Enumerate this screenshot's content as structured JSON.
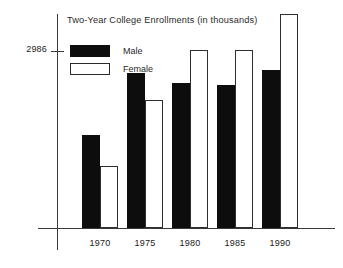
{
  "chart_data": {
    "type": "bar",
    "title": "Two-Year College Enrollments (in thousands)",
    "xlabel": "",
    "ylabel": "",
    "categories": [
      "1970",
      "1975",
      "1980",
      "1985",
      "1990"
    ],
    "series": [
      {
        "name": "Male",
        "color": "#0d0d0d",
        "fill": "solid-black",
        "values": [
          1299,
          2159,
          2024,
          1991,
          2210
        ]
      },
      {
        "name": "Female",
        "color": "#ffffff",
        "fill": "white-outlined",
        "values": [
          860,
          1788,
          2480,
          2480,
          2986
        ]
      }
    ],
    "ylim": [
      0,
      2986
    ],
    "ytick_values": [
      2986
    ],
    "ytick_labels": [
      "2986"
    ],
    "grid": false,
    "legend_position": "top-left-inside",
    "axis_color": "#3a3a3a",
    "background": "#ffffff"
  },
  "title": {
    "text": "Two-Year College Enrollments (in thousands)"
  },
  "yaxis": {
    "tick_label": "2986"
  },
  "legend": {
    "items": [
      {
        "label": "Male"
      },
      {
        "label": "Female"
      }
    ]
  },
  "xaxis": {
    "labels": [
      "1970",
      "1975",
      "1980",
      "1985",
      "1990"
    ]
  }
}
